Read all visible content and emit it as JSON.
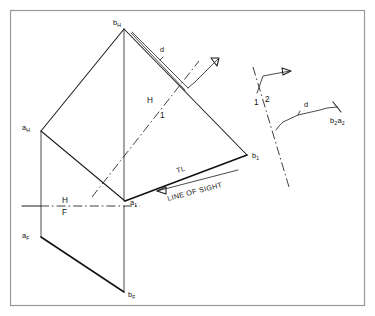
{
  "figure": {
    "background_color": "#ffffff",
    "border_color": "#9a9a9a",
    "line_color": "#1c1c1c",
    "width": 375,
    "height": 316
  },
  "labels": {
    "b_h": {
      "base": "b",
      "sub": "H"
    },
    "a_h": {
      "base": "a",
      "sub": "H"
    },
    "b_1": {
      "base": "b",
      "sub": "1"
    },
    "a_1": {
      "base": "a",
      "sub": "1"
    },
    "a_f": {
      "base": "a",
      "sub": "F"
    },
    "b_f": {
      "base": "b",
      "sub": "F"
    },
    "b2a2": {
      "base1": "b",
      "sub1": "2",
      "base2": "a",
      "sub2": "2"
    },
    "d_main": "d",
    "d_aux": "d",
    "ref_h_top": "H",
    "ref_1_bottom": "1",
    "ref_h_front": "H",
    "ref_f_front": "F",
    "ref_1_aux": "1",
    "ref_2_aux": "2",
    "true_length": "TL",
    "line_of_sight": "LINE OF SIGHT"
  },
  "geometry": {
    "points": {
      "b_h": [
        124,
        29
      ],
      "a_h": [
        41,
        131
      ],
      "b_1": [
        247,
        155
      ],
      "a_1": [
        125,
        201
      ],
      "a_f": [
        41,
        237
      ],
      "b_f": [
        124,
        292
      ],
      "hf_line_left": [
        22,
        206
      ],
      "hf_line_right": [
        140,
        206
      ]
    },
    "reference_lines": {
      "h1_line": {
        "from": [
          93,
          196
        ],
        "to": [
          198,
          62
        ]
      },
      "hf_line": {
        "from": [
          22,
          206
        ],
        "to": [
          140,
          206
        ]
      },
      "aux12_line": {
        "from": [
          253,
          67
        ],
        "to": [
          289,
          187
        ]
      }
    },
    "line_of_sight_arrow": {
      "from": [
        240,
        168
      ],
      "to": [
        155,
        190
      ]
    },
    "aux_view_polyline": [
      [
        276,
        129
      ],
      [
        282,
        125
      ],
      [
        285,
        122
      ],
      [
        300,
        114
      ],
      [
        330,
        108
      ],
      [
        340,
        106
      ]
    ]
  },
  "annotations": {
    "tl_note": "TL",
    "los_note": "LINE OF SIGHT",
    "dimension_main": "d",
    "dimension_aux": "d"
  }
}
